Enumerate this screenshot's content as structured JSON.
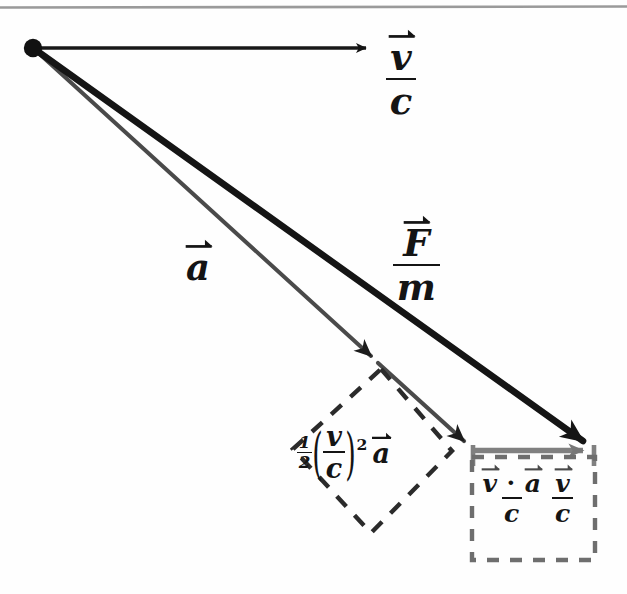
{
  "figure": {
    "kind": "vector-diagram",
    "background_color": "#fefefe",
    "ink_color": "#141414",
    "secondary_ink_color": "#6e6e6e",
    "top_rule": {
      "color": "#9a9a9a"
    }
  },
  "origin_dot": {
    "name": "vector-origin"
  },
  "labels": {
    "v_over_c": {
      "numerator": "v",
      "denominator": "c",
      "aria": "v vector over c"
    },
    "F_over_m": {
      "numerator": "F",
      "denominator": "m",
      "aria": "F vector over m"
    },
    "a": {
      "glyph": "a",
      "aria": "a vector"
    },
    "half_vc_squared_a": {
      "coefficient_numerator": "1",
      "coefficient_denominator": "2",
      "paren_open": "(",
      "inner_numerator": "v",
      "inner_denominator": "c",
      "paren_close": ")",
      "exponent": "2",
      "vector": "a",
      "aria": "one half times quantity v over c squared times a vector"
    },
    "boxed_projection": {
      "term1_numerator_left": "v",
      "term1_dot": "·",
      "term1_numerator_right": "a",
      "term1_denominator": "c",
      "term2_numerator": "v",
      "term2_denominator": "c",
      "aria": "quantity v vector dot a vector over c times v vector over c"
    }
  },
  "vectors": [
    {
      "name": "v-over-c-vector",
      "label_key": "v_over_c",
      "style": "solid-black-thin",
      "from": [
        33,
        48
      ],
      "to": [
        378,
        48
      ]
    },
    {
      "name": "F-over-m-vector",
      "label_key": "F_over_m",
      "style": "solid-black-thick",
      "from": [
        33,
        48
      ],
      "to": [
        595,
        450
      ]
    },
    {
      "name": "a-vector",
      "label_key": "a",
      "style": "solid-gray-thin",
      "from": [
        33,
        48
      ],
      "to": [
        378,
        363
      ]
    },
    {
      "name": "half-vc-squared-a-vector",
      "label_key": "half_vc_squared_a",
      "style": "solid-gray-thin",
      "from": [
        378,
        363
      ],
      "to": [
        470,
        447
      ]
    },
    {
      "name": "projection-vector",
      "label_key": "boxed_projection",
      "style": "solid-gray-medium",
      "from": [
        472,
        450
      ],
      "to": [
        595,
        450
      ]
    }
  ],
  "annotation_boxes": [
    {
      "name": "diamond-dashed-box",
      "shape": "rotated-square",
      "label_key": "half_vc_squared_a",
      "stroke": "#2b2b2b",
      "dash": "13 11"
    },
    {
      "name": "rectangle-dashed-box",
      "shape": "rectangle",
      "label_key": "boxed_projection",
      "stroke": "#6e6e6e",
      "dash": "11 10",
      "rect": [
        472,
        457,
        123,
        103
      ]
    }
  ]
}
